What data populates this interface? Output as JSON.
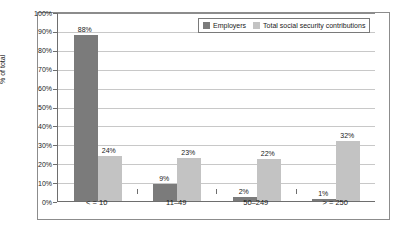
{
  "chart_data": {
    "type": "bar",
    "title": "",
    "subtitle": "",
    "xlabel": "",
    "ylabel": "% of total",
    "categories": [
      "< = 10",
      "11–49",
      "50–249",
      "> = 250"
    ],
    "series": [
      {
        "name": "Employers",
        "color": "#7b7b7b",
        "values": [
          88,
          9,
          2,
          1
        ],
        "labels": [
          "88%",
          "9%",
          "2%",
          "1%"
        ]
      },
      {
        "name": "Total social security contributions",
        "color": "#c3c3c3",
        "values": [
          24,
          23,
          22,
          32
        ],
        "labels": [
          "24%",
          "23%",
          "22%",
          "32%"
        ]
      }
    ],
    "ylim": [
      0,
      100
    ],
    "y_ticks": [
      0,
      10,
      20,
      30,
      40,
      50,
      60,
      70,
      80,
      90,
      100
    ],
    "y_tick_labels": [
      "0%",
      "10%",
      "20%",
      "30%",
      "40%",
      "50%",
      "60%",
      "70%",
      "80%",
      "90%",
      "100%"
    ],
    "grid": true,
    "grid_axis": "y",
    "legend_position": "top-right",
    "value_labels": true,
    "frame": true
  },
  "legend": {
    "entries": [
      {
        "label": "Employers"
      },
      {
        "label": "Total social security contributions"
      }
    ]
  }
}
